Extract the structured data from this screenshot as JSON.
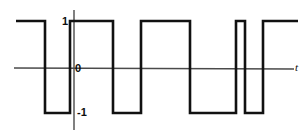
{
  "figure": {
    "width": 307,
    "height": 138,
    "background": "#ffffff"
  },
  "labels": {
    "high": "1",
    "origin": "0",
    "low": "-1",
    "axis_x": "t"
  },
  "colors": {
    "waveform": "#111111",
    "axis": "#4a4a4a",
    "text": "#0d0d0d",
    "background": "#ffffff"
  },
  "geometry": {
    "y_high": 21,
    "y_zero": 68,
    "y_low": 113,
    "x_axis_start": 14,
    "x_axis_end": 294,
    "y_axis_x": 74,
    "y_axis_top": 10,
    "y_axis_bottom": 130,
    "wave_stroke": 2.6,
    "axis_stroke": 1.4
  },
  "chart_data": {
    "type": "line",
    "xlabel": "t",
    "ylabel": "",
    "ylim": [
      -1,
      1
    ],
    "grid": false,
    "legend": false,
    "levels": [
      1,
      -1
    ],
    "segments": [
      {
        "level": 1,
        "x_start": 16,
        "x_end": 45
      },
      {
        "level": -1,
        "x_start": 45,
        "x_end": 70
      },
      {
        "level": 1,
        "x_start": 70,
        "x_end": 113
      },
      {
        "level": -1,
        "x_start": 113,
        "x_end": 141
      },
      {
        "level": 1,
        "x_start": 141,
        "x_end": 190
      },
      {
        "level": -1,
        "x_start": 190,
        "x_end": 236
      },
      {
        "level": 1,
        "x_start": 236,
        "x_end": 245
      },
      {
        "level": -1,
        "x_start": 245,
        "x_end": 263
      },
      {
        "level": 1,
        "x_start": 263,
        "x_end": 298
      }
    ],
    "transitions": [
      45,
      70,
      113,
      141,
      190,
      236,
      245,
      263
    ],
    "path": "M 16 21 L 45 21 L 45 113 L 70 113 L 70 21 L 113 21 L 113 113 L 141 113 L 141 21 L 190 21 L 190 113 L 236 113 L 236 21 L 245 21 L 245 113 L 263 113 L 263 21 L 298 21"
  }
}
